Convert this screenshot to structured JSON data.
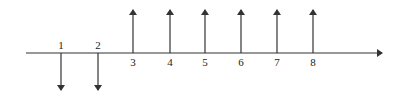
{
  "diagram": {
    "type": "cash-flow-diagram",
    "axis": {
      "x_start": 26,
      "x_end": 382,
      "y": 53,
      "color": "#333333"
    },
    "periods": [
      {
        "label": "1",
        "x": 61,
        "direction": "down"
      },
      {
        "label": "2",
        "x": 98,
        "direction": "down"
      },
      {
        "label": "3",
        "x": 133,
        "direction": "up"
      },
      {
        "label": "4",
        "x": 170,
        "direction": "up"
      },
      {
        "label": "5",
        "x": 205,
        "direction": "up"
      },
      {
        "label": "6",
        "x": 241,
        "direction": "up"
      },
      {
        "label": "7",
        "x": 277,
        "direction": "up"
      },
      {
        "label": "8",
        "x": 313,
        "direction": "up"
      }
    ],
    "arrow_color": "#333333"
  }
}
